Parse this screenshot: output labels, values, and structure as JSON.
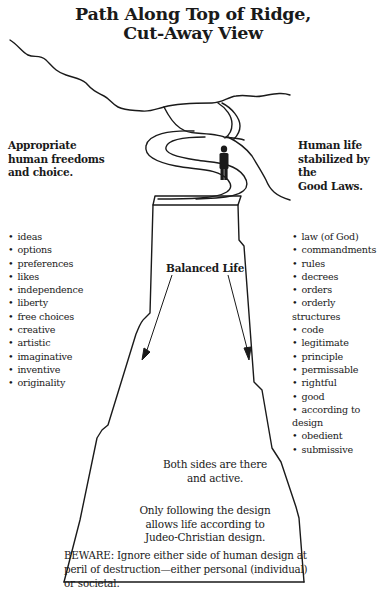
{
  "title": {
    "line1": "Path Along Top of Ridge,",
    "line2": "Cut-Away View"
  },
  "left": {
    "heading_lines": [
      "Appropriate",
      "human freedoms",
      "and choice."
    ],
    "items": [
      "ideas",
      "options",
      "preferences",
      "likes",
      "independence",
      "liberty",
      "free choices",
      "creative",
      "artistic",
      "imaginative",
      "inventive",
      "originality"
    ]
  },
  "right": {
    "heading_lines": [
      "Human life",
      "stabilized by the",
      "Good Laws."
    ],
    "items": [
      "law (of God)",
      "commandments",
      "rules",
      "decrees",
      "orders",
      "orderly structures",
      "code",
      "legitimate",
      "principle",
      "permissable",
      "rightful",
      "good",
      "according to design",
      "obedient",
      "submissive"
    ]
  },
  "center": {
    "balanced_label": "Balanced Life",
    "both_sides_lines": [
      "Both sides are there",
      "and active."
    ],
    "only_following_lines": [
      "Only following the design",
      "allows life according to",
      "Judeo-Christian design."
    ],
    "beware_lines": [
      "BEWARE: Ignore either side of human design at",
      "peril of destruction—either personal (individual)",
      "or societal."
    ]
  },
  "figure": {
    "icon": "person-silhouette-icon",
    "stroke_color": "#1a1a1a"
  }
}
